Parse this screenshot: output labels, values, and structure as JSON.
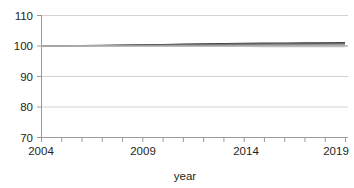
{
  "chart_data": {
    "type": "line",
    "title": "",
    "xlabel": "year",
    "ylabel": "",
    "xlim": [
      2004,
      2019
    ],
    "ylim": [
      70,
      110
    ],
    "grid": true,
    "legend": "none",
    "x": [
      2004,
      2005,
      2006,
      2007,
      2008,
      2009,
      2010,
      2011,
      2012,
      2013,
      2014,
      2015,
      2016,
      2017,
      2018,
      2019
    ],
    "y_ticks": [
      70,
      80,
      90,
      100,
      110
    ],
    "y_tick_labels": [
      "70",
      "80",
      "90",
      "100",
      "110"
    ],
    "x_ticks": [
      2004,
      2005,
      2006,
      2007,
      2008,
      2009,
      2010,
      2011,
      2012,
      2013,
      2014,
      2015,
      2016,
      2017,
      2018,
      2019
    ],
    "x_tick_labels_shown": [
      "2004",
      "2009",
      "2014",
      "2019"
    ],
    "x_labeled_ticks": [
      2004,
      2009,
      2014,
      2019
    ],
    "series": [
      {
        "name": "series-1",
        "color": "#3b3b3b",
        "values": [
          100.0,
          100.05,
          100.12,
          100.2,
          100.3,
          100.4,
          100.5,
          100.6,
          100.7,
          100.8,
          100.88,
          100.95,
          101.0,
          101.05,
          101.08,
          101.1
        ]
      },
      {
        "name": "series-2",
        "color": "#555555",
        "values": [
          100.0,
          100.04,
          100.1,
          100.16,
          100.24,
          100.32,
          100.4,
          100.48,
          100.56,
          100.63,
          100.7,
          100.76,
          100.8,
          100.84,
          100.87,
          100.9
        ]
      },
      {
        "name": "series-3",
        "color": "#6e6e6e",
        "values": [
          100.0,
          100.03,
          100.07,
          100.12,
          100.18,
          100.24,
          100.3,
          100.36,
          100.42,
          100.47,
          100.52,
          100.56,
          100.6,
          100.63,
          100.65,
          100.67
        ]
      },
      {
        "name": "series-4",
        "color": "#8a8a8a",
        "values": [
          100.0,
          100.02,
          100.04,
          100.07,
          100.1,
          100.14,
          100.18,
          100.22,
          100.26,
          100.29,
          100.32,
          100.35,
          100.37,
          100.39,
          100.4,
          100.41
        ]
      },
      {
        "name": "series-5",
        "color": "#a8a8a8",
        "values": [
          100.0,
          100.0,
          100.0,
          100.0,
          100.0,
          100.0,
          100.0,
          100.0,
          100.0,
          100.0,
          100.0,
          100.0,
          100.0,
          100.0,
          100.0,
          100.0
        ]
      },
      {
        "name": "series-6",
        "color": "#bdbdbd",
        "values": [
          100.0,
          99.99,
          99.98,
          99.96,
          99.94,
          99.92,
          99.9,
          99.88,
          99.86,
          99.84,
          99.82,
          99.81,
          99.8,
          99.79,
          99.78,
          99.77
        ]
      }
    ],
    "colors": {
      "gridline": "#d4d4d4",
      "axis": "#9a9a9a",
      "text": "#231f20",
      "background": "#ffffff"
    }
  },
  "axis": {
    "y_labels": {
      "t110": "110",
      "t100": "100",
      "t90": "90",
      "t80": "80",
      "t70": "70"
    },
    "x_labels": {
      "t2004": "2004",
      "t2009": "2009",
      "t2014": "2014",
      "t2019": "2019"
    },
    "x_title": "year"
  }
}
